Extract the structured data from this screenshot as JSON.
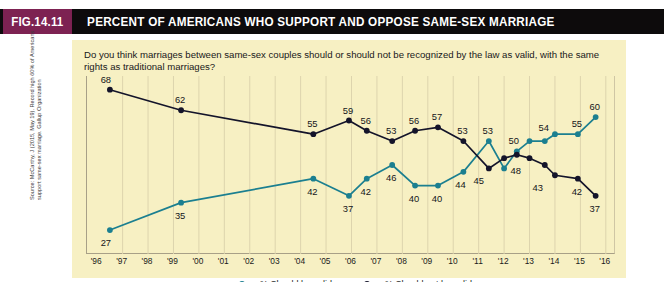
{
  "figure": {
    "number_label": "FIG.14.11",
    "title": "PERCENT OF AMERICANS WHO SUPPORT AND OPPOSE SAME-SEX MARRIAGE",
    "badge_color": "#7d2252",
    "titlebar_color": "#0d0b0c",
    "panel_color": "#f7f0c3"
  },
  "question": "Do you think marriages between same-sex couples should or should not be recognized by the law as valid, with the same rights as traditional marriages?",
  "source": "Source: McCarthy, J (2015, May 19). Record high 60% of Americans support same-sex marriage. Gallup Organization",
  "legend": [
    {
      "label": "% Should be valid",
      "color": "#1b7f90"
    },
    {
      "label": "% Should not be valid",
      "color": "#14142a"
    }
  ],
  "chart_data": {
    "type": "line",
    "title": "PERCENT OF AMERICANS WHO SUPPORT AND OPPOSE SAME-SEX MARRIAGE",
    "subtitle": "Do you think marriages between same-sex couples should or should not be recognized by the law as valid, with the same rights as traditional marriages?",
    "xlabel": "",
    "ylabel": "",
    "xlim": [
      1995.6,
      2016.4
    ],
    "ylim": [
      20,
      72
    ],
    "grid": "vertical-only",
    "legend_position": "bottom-center",
    "xtick_labels": [
      "'96",
      "'97",
      "'98",
      "'99",
      "'00",
      "'01",
      "'02",
      "'03",
      "'04",
      "'05",
      "'06",
      "'07",
      "'08",
      "'09",
      "'10",
      "'11",
      "'12",
      "'13",
      "'14",
      "'15",
      "'16"
    ],
    "xtick_values": [
      1996,
      1997,
      1998,
      1999,
      2000,
      2001,
      2002,
      2003,
      2004,
      2005,
      2006,
      2007,
      2008,
      2009,
      2010,
      2011,
      2012,
      2013,
      2014,
      2015,
      2016
    ],
    "series": [
      {
        "name": "% Should be valid",
        "color": "#1b7f90",
        "x": [
          1996.5,
          1999.3,
          2004.5,
          2005.9,
          2006.6,
          2007.6,
          2008.5,
          2009.4,
          2010.4,
          2011.4,
          2012.0,
          2012.5,
          2013.0,
          2013.6,
          2014.0,
          2014.9,
          2015.6
        ],
        "values": [
          27,
          35,
          42,
          37,
          42,
          46,
          40,
          40,
          44,
          53,
          45,
          50,
          53,
          53,
          55,
          55,
          60
        ],
        "labels": [
          "27",
          "35",
          "42",
          "37",
          "42",
          "46",
          "40",
          "40",
          "44",
          "53",
          "",
          "50",
          "",
          "54",
          "",
          "55",
          "60"
        ]
      },
      {
        "name": "% Should not be valid",
        "color": "#14142a",
        "x": [
          1996.5,
          1999.3,
          2004.5,
          2005.9,
          2006.6,
          2007.6,
          2008.5,
          2009.4,
          2010.4,
          2011.4,
          2012.0,
          2012.5,
          2013.0,
          2013.6,
          2014.0,
          2014.9,
          2015.6
        ],
        "values": [
          68,
          62,
          55,
          59,
          56,
          53,
          56,
          57,
          53,
          45,
          48,
          49,
          48,
          46,
          43,
          42,
          37
        ],
        "labels": [
          "68",
          "62",
          "55",
          "59",
          "56",
          "53",
          "56",
          "57",
          "53",
          "45",
          "",
          "48",
          "",
          "43",
          "",
          "42",
          "37"
        ]
      }
    ],
    "annotations": [
      {
        "text": "68",
        "series": "% Should not be valid",
        "x": 1996.5,
        "y": 68
      },
      {
        "text": "62",
        "series": "% Should not be valid",
        "x": 1999.3,
        "y": 62
      },
      {
        "text": "55",
        "series": "% Should not be valid",
        "x": 2004.5,
        "y": 55
      },
      {
        "text": "59",
        "series": "% Should not be valid",
        "x": 2005.9,
        "y": 59
      },
      {
        "text": "56",
        "series": "% Should not be valid",
        "x": 2006.6,
        "y": 56
      },
      {
        "text": "53",
        "series": "% Should not be valid",
        "x": 2007.6,
        "y": 53
      },
      {
        "text": "56",
        "series": "% Should not be valid",
        "x": 2008.5,
        "y": 56
      },
      {
        "text": "57",
        "series": "% Should not be valid",
        "x": 2009.4,
        "y": 57
      },
      {
        "text": "53",
        "series": "% Should not be valid",
        "x": 2010.4,
        "y": 53
      },
      {
        "text": "45",
        "series": "% Should not be valid",
        "x": 2011.4,
        "y": 45
      },
      {
        "text": "48",
        "series": "% Should not be valid",
        "x": 2012.5,
        "y": 48
      },
      {
        "text": "43",
        "series": "% Should not be valid",
        "x": 2013.6,
        "y": 43
      },
      {
        "text": "42",
        "series": "% Should not be valid",
        "x": 2014.9,
        "y": 42
      },
      {
        "text": "37",
        "series": "% Should not be valid",
        "x": 2015.6,
        "y": 37
      },
      {
        "text": "27",
        "series": "% Should be valid",
        "x": 1996.5,
        "y": 27
      },
      {
        "text": "35",
        "series": "% Should be valid",
        "x": 1999.3,
        "y": 35
      },
      {
        "text": "42",
        "series": "% Should be valid",
        "x": 2004.5,
        "y": 42
      },
      {
        "text": "37",
        "series": "% Should be valid",
        "x": 2005.9,
        "y": 37
      },
      {
        "text": "42",
        "series": "% Should be valid",
        "x": 2006.6,
        "y": 42
      },
      {
        "text": "46",
        "series": "% Should be valid",
        "x": 2007.6,
        "y": 46
      },
      {
        "text": "40",
        "series": "% Should be valid",
        "x": 2008.5,
        "y": 40
      },
      {
        "text": "40",
        "series": "% Should be valid",
        "x": 2009.4,
        "y": 40
      },
      {
        "text": "44",
        "series": "% Should be valid",
        "x": 2010.4,
        "y": 44
      },
      {
        "text": "53",
        "series": "% Should be valid",
        "x": 2011.4,
        "y": 53
      },
      {
        "text": "50",
        "series": "% Should be valid",
        "x": 2012.5,
        "y": 50
      },
      {
        "text": "54",
        "series": "% Should be valid",
        "x": 2013.6,
        "y": 54
      },
      {
        "text": "55",
        "series": "% Should be valid",
        "x": 2014.9,
        "y": 55
      },
      {
        "text": "60",
        "series": "% Should be valid",
        "x": 2015.6,
        "y": 60
      }
    ]
  }
}
